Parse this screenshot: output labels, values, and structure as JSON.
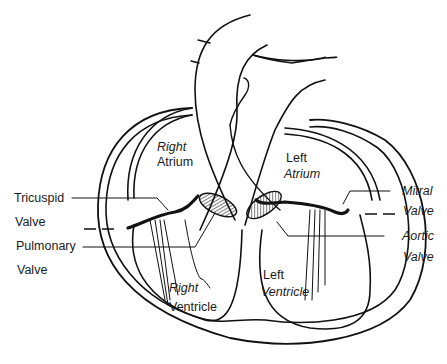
{
  "diagram": {
    "colors": {
      "line": "#111111",
      "background": "#ffffff",
      "text": "#1a1a1a"
    },
    "labels": {
      "right_atrium": {
        "line1": "Right",
        "line2": "Atrium"
      },
      "left_atrium": {
        "line1": "Left",
        "line2": "Atrium"
      },
      "tricuspid_valve": {
        "line1": "Tricuspid",
        "line2": "Valve"
      },
      "pulmonary_valve": {
        "line1": "Pulmonary",
        "line2": "Valve"
      },
      "mitral_valve": {
        "line1": "Mitral",
        "line2": "Valve"
      },
      "aortic_valve": {
        "line1": "Aortic",
        "line2": "Valve"
      },
      "right_ventricle": {
        "line1": "Right",
        "line2": "Ventricle"
      },
      "left_ventricle": {
        "line1": "Left",
        "line2": "Ventricle"
      }
    }
  }
}
